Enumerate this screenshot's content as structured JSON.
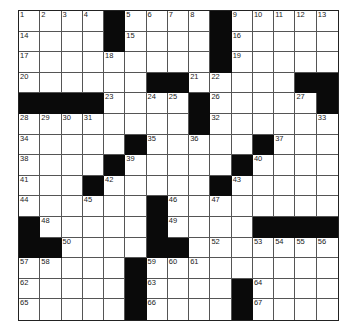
{
  "puzzle": {
    "rows": 15,
    "cols": 15,
    "layout": [
      "....#....#.....",
      "....#....#.....",
      ".........#.....",
      "......##.....##",
      "####....#.....#",
      "........#......",
      ".....#.....#...",
      "....#.....#....",
      "...#.....#.....",
      "......#........",
      "#.....#....####",
      "##....##.......",
      ".....#.........",
      ".....#....#....",
      ".....#....#...."
    ],
    "numbers": {
      "0,0": "1",
      "0,1": "2",
      "0,2": "3",
      "0,3": "4",
      "0,5": "5",
      "0,6": "6",
      "0,7": "7",
      "0,8": "8",
      "0,10": "9",
      "0,11": "10",
      "0,12": "11",
      "0,13": "12",
      "0,14": "13",
      "1,0": "14",
      "1,5": "15",
      "1,10": "16",
      "2,0": "17",
      "2,4": "18",
      "2,10": "19",
      "3,0": "20",
      "3,8": "21",
      "3,9": "22",
      "4,4": "23",
      "4,6": "24",
      "4,7": "25",
      "4,9": "26",
      "4,13": "27",
      "5,0": "28",
      "5,1": "29",
      "5,2": "30",
      "5,3": "31",
      "5,9": "32",
      "5,14": "33",
      "6,0": "34",
      "6,6": "35",
      "6,8": "36",
      "6,12": "37",
      "7,0": "38",
      "7,5": "39",
      "7,11": "40",
      "8,0": "41",
      "8,4": "42",
      "8,10": "43",
      "9,0": "44",
      "9,3": "45",
      "9,7": "46",
      "9,9": "47",
      "10,1": "48",
      "10,7": "49",
      "11,2": "50",
      "11,6": "51",
      "11,9": "52",
      "11,11": "53",
      "11,12": "54",
      "11,13": "55",
      "11,14": "56",
      "12,0": "57",
      "12,1": "58",
      "12,6": "59",
      "12,7": "60",
      "12,8": "61",
      "13,0": "62",
      "13,6": "63",
      "13,11": "64",
      "14,0": "65",
      "14,6": "66",
      "14,11": "67"
    }
  },
  "colors": {
    "black_cell": "#0a0a0a",
    "white_cell": "#ffffff",
    "grid_line": "#555555"
  }
}
